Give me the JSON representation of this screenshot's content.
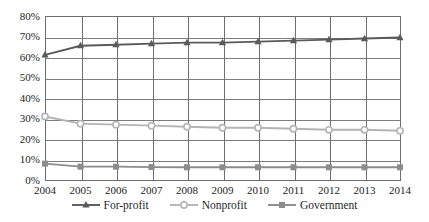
{
  "chart_data": {
    "type": "line",
    "title": "",
    "subtitle": "",
    "xlabel": "",
    "ylabel": "",
    "categories": [
      "2004",
      "2005",
      "2006",
      "2007",
      "2008",
      "2009",
      "2010",
      "2011",
      "2012",
      "2013",
      "2014"
    ],
    "x": [
      2004,
      2005,
      2006,
      2007,
      2008,
      2009,
      2010,
      2011,
      2012,
      2013,
      2014
    ],
    "ylim": [
      0,
      80
    ],
    "ytick_values": [
      0,
      10,
      20,
      30,
      40,
      50,
      60,
      70,
      80
    ],
    "ytick_labels": [
      "0%",
      "10%",
      "20%",
      "30%",
      "40%",
      "50%",
      "60%",
      "70%",
      "80%"
    ],
    "grid": "both",
    "legend_position": "bottom",
    "series": [
      {
        "name": "For-profit",
        "marker": "triangle",
        "color": "#5a5a5a",
        "values": [
          61,
          65.5,
          66,
          66.5,
          67,
          67,
          67.5,
          68,
          68.5,
          69,
          69.5
        ]
      },
      {
        "name": "Nonprofit",
        "marker": "circle",
        "color": "#b4b4b4",
        "values": [
          31,
          27.5,
          27,
          26.5,
          26,
          25.5,
          25.5,
          25,
          24.5,
          24.5,
          24
        ]
      },
      {
        "name": "Government",
        "marker": "square",
        "color": "#8c8c8c",
        "values": [
          8,
          6.5,
          6.5,
          6.3,
          6.2,
          6.2,
          6.2,
          6.2,
          6.2,
          6.2,
          6.2
        ]
      }
    ]
  },
  "legend": {
    "items": [
      {
        "label": "For-profit",
        "marker": "triangle-marker",
        "color": "#5a5a5a"
      },
      {
        "label": "Nonprofit",
        "marker": "circle-marker",
        "color": "#b4b4b4"
      },
      {
        "label": "Government",
        "marker": "square-marker",
        "color": "#8c8c8c"
      }
    ]
  },
  "axes": {
    "y_labels": [
      "80%",
      "70%",
      "60%",
      "50%",
      "40%",
      "30%",
      "20%",
      "10%",
      "0%"
    ],
    "x_labels": [
      "2004",
      "2005",
      "2006",
      "2007",
      "2008",
      "2009",
      "2010",
      "2011",
      "2012",
      "2013",
      "2014"
    ]
  },
  "colors": {
    "for_profit": "#5a5a5a",
    "nonprofit": "#b4b4b4",
    "government": "#8c8c8c",
    "axis": "#6e6e6e",
    "grid": "#7d7d7d",
    "text": "#232323",
    "background": "#ffffff"
  }
}
